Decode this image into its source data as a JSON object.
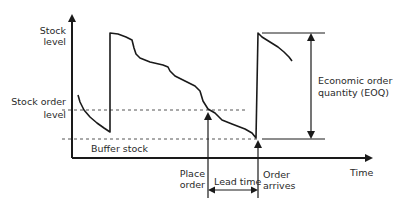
{
  "diagram": {
    "axes": {
      "y_label_line1": "Stock",
      "y_label_line2": "level",
      "x_label": "Time"
    },
    "levels": {
      "reorder_line1": "Stock order",
      "reorder_line2": "level",
      "buffer": "Buffer stock"
    },
    "annotations": {
      "eoq_line1": "Economic order",
      "eoq_line2": "quantity (EOQ)",
      "place_order_line1": "Place",
      "place_order_line2": "order",
      "lead_time": "Lead time",
      "order_arrives_line1": "Order",
      "order_arrives_line2": "arrives"
    },
    "colors": {
      "line": "#1a1a1a",
      "text": "#2a2a2a",
      "dashed": "#555555",
      "background": "#ffffff"
    }
  }
}
